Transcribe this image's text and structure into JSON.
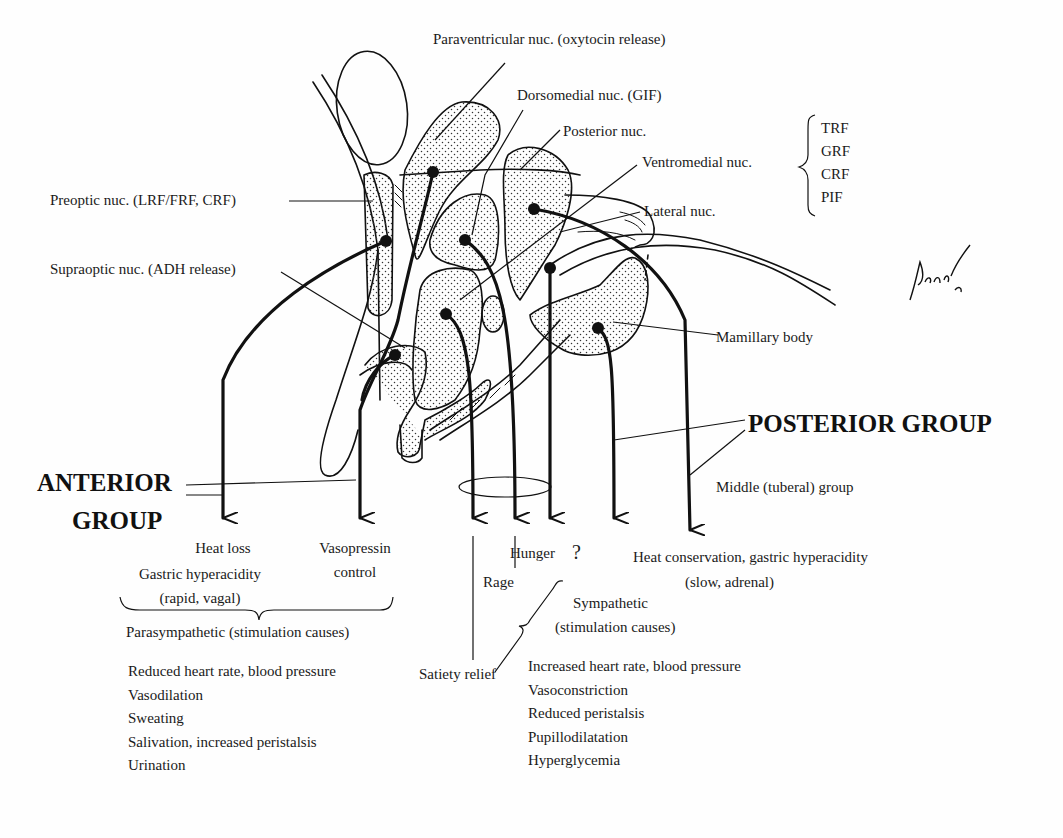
{
  "figure": {
    "signature": "Pansky",
    "nuclei_labels": {
      "paraventricular": "Paraventricular nuc. (oxytocin release)",
      "dorsomedial": "Dorsomedial nuc. (GIF)",
      "posterior": "Posterior nuc.",
      "ventromedial": "Ventromedial nuc.",
      "lateral": "Lateral nuc.",
      "preoptic": "Preoptic nuc. (LRF/FRF, CRF)",
      "supraoptic": "Supraoptic nuc. (ADH release)",
      "mamillary": "Mamillary body"
    },
    "releasing_factors": [
      "TRF",
      "GRF",
      "CRF",
      "PIF"
    ],
    "groups": {
      "anterior_line1": "ANTERIOR",
      "anterior_line2": "GROUP",
      "posterior": "POSTERIOR GROUP",
      "middle": "Middle (tuberal) group"
    },
    "outcomes": {
      "heat_loss": "Heat loss",
      "gastric_rapid_1": "Gastric hyperacidity",
      "gastric_rapid_2": "(rapid, vagal)",
      "vasopressin_1": "Vasopressin",
      "vasopressin_2": "control",
      "satiety": "Satiety relief",
      "rage": "Rage",
      "hunger": "Hunger",
      "unknown": "?",
      "heat_conservation_1": "Heat conservation, gastric hyperacidity",
      "heat_conservation_2": "(slow, adrenal)"
    },
    "parasympathetic": {
      "heading": "Parasympathetic (stimulation causes)",
      "effects": [
        "Reduced heart rate, blood pressure",
        "Vasodilation",
        "Sweating",
        "Salivation, increased peristalsis",
        "Urination"
      ]
    },
    "sympathetic": {
      "heading_1": "Sympathetic",
      "heading_2": "(stimulation causes)",
      "effects": [
        "Increased heart rate, blood pressure",
        "Vasoconstriction",
        "Reduced peristalsis",
        "Pupillodilatation",
        "Hyperglycemia"
      ]
    },
    "colors": {
      "ink": "#111111",
      "paper": "#fefefe"
    }
  }
}
